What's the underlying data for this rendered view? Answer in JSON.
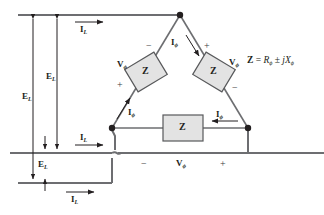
{
  "figure": {
    "type": "circuit-diagram",
    "colors": {
      "wire": "#6d6e71",
      "dark_wire": "#58595b",
      "box_fill": "#e3e3e3",
      "box_stroke": "#58595b",
      "text": "#231f20",
      "background": "#ffffff"
    }
  },
  "symbols": {
    "line_voltage": "E",
    "line_voltage_sub": "L",
    "line_current": "I",
    "line_current_sub": "L",
    "phase_voltage": "V",
    "phase_voltage_sub": "ϕ",
    "phase_current": "I",
    "phase_current_sub": "ϕ",
    "impedance": "Z",
    "plus": "+",
    "minus": "−"
  },
  "equation": {
    "lhs": "Z",
    "eq": "=",
    "r": "R",
    "r_sub": "ϕ",
    "pm": "±",
    "j": "j",
    "x": "X",
    "x_sub": "ϕ",
    "full_text": "Z = Rϕ ± jXϕ"
  },
  "labels": {
    "line_voltages": [
      {
        "id": "EL-outer",
        "text": "E",
        "sub": "L"
      },
      {
        "id": "EL-middle",
        "text": "E",
        "sub": "L"
      },
      {
        "id": "EL-lower",
        "text": "E",
        "sub": "L"
      }
    ],
    "line_currents": [
      {
        "id": "IL-top",
        "text": "I",
        "sub": "L"
      },
      {
        "id": "IL-middle",
        "text": "I",
        "sub": "L"
      },
      {
        "id": "IL-bottom",
        "text": "I",
        "sub": "L"
      }
    ],
    "phase_currents": [
      {
        "id": "Iphi-top-right",
        "text": "I",
        "sub": "ϕ"
      },
      {
        "id": "Iphi-bottom-left",
        "text": "I",
        "sub": "ϕ"
      },
      {
        "id": "Iphi-bottom-right",
        "text": "I",
        "sub": "ϕ"
      }
    ],
    "phase_voltages": [
      {
        "id": "Vphi-left",
        "text": "V",
        "sub": "ϕ"
      },
      {
        "id": "Vphi-right",
        "text": "V",
        "sub": "ϕ"
      },
      {
        "id": "Vphi-bottom",
        "text": "V",
        "sub": "ϕ"
      }
    ],
    "impedances": [
      {
        "id": "Z-left",
        "text": "Z"
      },
      {
        "id": "Z-right",
        "text": "Z"
      },
      {
        "id": "Z-bottom",
        "text": "Z"
      }
    ],
    "polarities": [
      {
        "id": "pol-left-minus",
        "text": "−"
      },
      {
        "id": "pol-left-plus",
        "text": "+"
      },
      {
        "id": "pol-right-plus",
        "text": "+"
      },
      {
        "id": "pol-right-minus",
        "text": "−"
      },
      {
        "id": "pol-bottom-minus",
        "text": "−"
      },
      {
        "id": "pol-bottom-plus",
        "text": "+"
      }
    ]
  }
}
